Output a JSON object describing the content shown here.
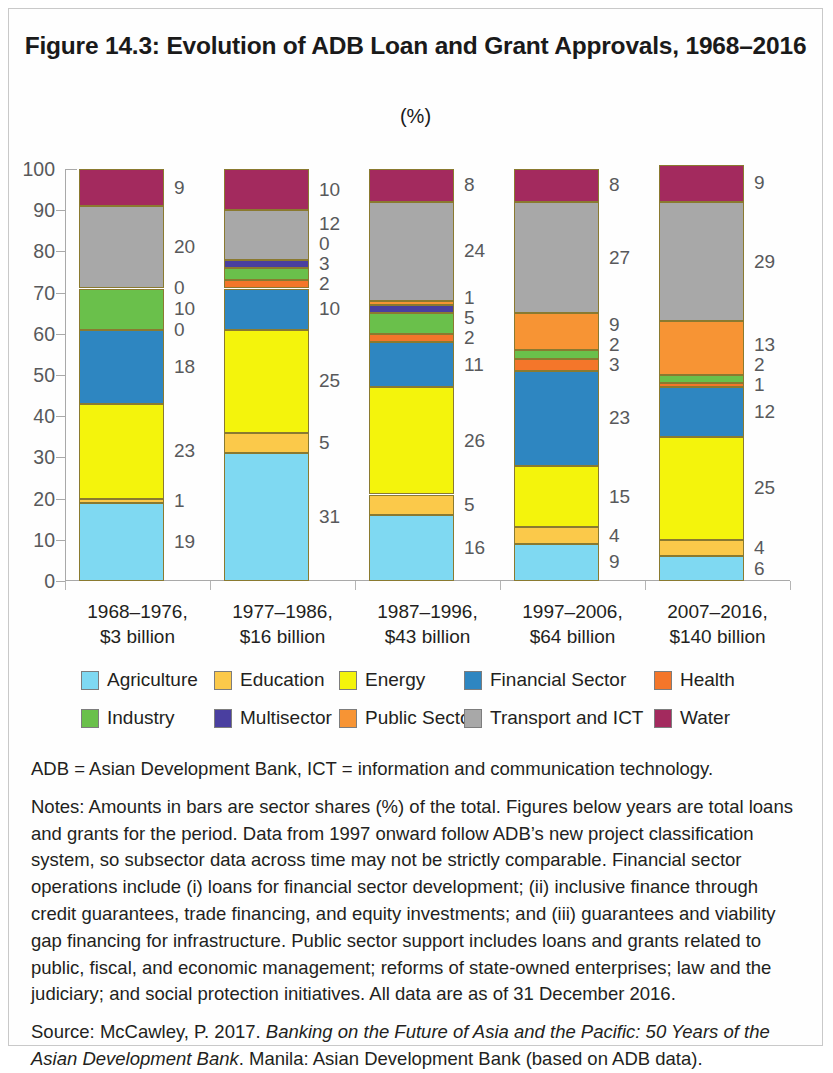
{
  "figure": {
    "title": "Figure 14.3: Evolution of ADB Loan and Grant Approvals, 1968–2016",
    "subtitle": "(%)"
  },
  "abbreviations": "ADB = Asian Development Bank, ICT = information and communication technology.",
  "notes": "Notes: Amounts in bars are sector shares (%) of the total. Figures below years are total loans and grants for the period. Data from 1997 onward follow ADB’s new project classification system, so subsector data across time may not be strictly comparable. Financial sector operations include (i) loans for financial sector development; (ii) inclusive finance through credit guarantees, trade financing, and equity investments; and (iii) guarantees and viability gap financing for infrastructure. Public sector support includes loans and grants related to public, fiscal, and economic management; reforms of state-owned enterprises; law and the judiciary; and social protection initiatives. All data are as of 31 December 2016.",
  "source": {
    "lead": "Source: McCawley, P. 2017. ",
    "italic_title": "Banking on the Future of Asia and the Pacific: 50 Years of the Asian Development Bank",
    "tail": ". Manila: Asian Development Bank (based on ADB data)."
  },
  "chart_data": {
    "type": "bar",
    "stacked": true,
    "title": "Figure 14.3: Evolution of ADB Loan and Grant Approvals, 1968–2016",
    "subtitle": "(%)",
    "xlabel": "",
    "ylabel": "",
    "ylim": [
      0,
      100
    ],
    "yticks": [
      0,
      10,
      20,
      30,
      40,
      50,
      60,
      70,
      80,
      90,
      100
    ],
    "grid": false,
    "legend_position": "bottom",
    "categories": [
      "1968–1976,\n$3 billion",
      "1977–1986,\n$16 billion",
      "1987–1996,\n$43 billion",
      "1997–2006,\n$64 billion",
      "2007–2016,\n$140 billion"
    ],
    "category_lines": [
      [
        "1968–1976,",
        "$3 billion"
      ],
      [
        "1977–1986,",
        "$16 billion"
      ],
      [
        "1987–1996,",
        "$43 billion"
      ],
      [
        "1997–2006,",
        "$64 billion"
      ],
      [
        "2007–2016,",
        "$140 billion"
      ]
    ],
    "series": [
      {
        "name": "Agriculture",
        "color": "#7fd9f2",
        "values": [
          19,
          31,
          16,
          9,
          6
        ]
      },
      {
        "name": "Education",
        "color": "#fcc councillors"
      }
    ],
    "stack_order": [
      "Agriculture",
      "Education",
      "Energy",
      "Financial Sector",
      "Health",
      "Industry",
      "Multisector",
      "Public Sector",
      "Transport and ICT",
      "Water"
    ],
    "series_full": [
      {
        "name": "Agriculture",
        "color": "#7fd9f2",
        "values": [
          19,
          31,
          16,
          9,
          6
        ]
      },
      {
        "name": "Education",
        "color": "#fcc css"
      }
    ]
  },
  "legend": {
    "items": [
      {
        "label": "Agriculture",
        "color": "#7fd9f2"
      },
      {
        "label": "Education",
        "color": "#fbc94a"
      },
      {
        "label": "Energy",
        "color": "#f4f40c"
      },
      {
        "label": "Financial Sector",
        "color": "#2e86c1"
      },
      {
        "label": "Health",
        "color": "#f4762a"
      },
      {
        "label": "Industry",
        "color": "#6ac04b"
      },
      {
        "label": "Multisector",
        "color": "#4a3fa0"
      },
      {
        "label": "Public Sector",
        "color": "#f79434"
      },
      {
        "label": "Transport and ICT",
        "color": "#a8a8a8"
      },
      {
        "label": "Water",
        "color": "#a32a5e"
      }
    ]
  },
  "axis": {
    "y_tick_labels": [
      "100",
      "90",
      "80",
      "70",
      "60",
      "50",
      "40",
      "30",
      "20",
      "10",
      "0"
    ]
  },
  "bars": [
    {
      "category_line1": "1968–1976,",
      "category_line2": "$3 billion",
      "segments": [
        {
          "sector": "Agriculture",
          "value": 19,
          "label": "19",
          "color": "#7fd9f2"
        },
        {
          "sector": "Education",
          "value": 1,
          "label": "1",
          "color": "#fbc94a"
        },
        {
          "sector": "Energy",
          "value": 23,
          "label": "23",
          "color": "#f4f40c"
        },
        {
          "sector": "Financial Sector",
          "value": 18,
          "label": "18",
          "color": "#2e86c1"
        },
        {
          "sector": "Health",
          "value": 0,
          "label": "0",
          "color": "#f4762a"
        },
        {
          "sector": "Industry",
          "value": 10,
          "label": "10",
          "color": "#6ac04b"
        },
        {
          "sector": "Multisector",
          "value": 0,
          "label": "0",
          "color": "#4a3fa0"
        },
        {
          "sector": "Public Sector",
          "value": 0,
          "label": "",
          "color": "#f79434"
        },
        {
          "sector": "Transport and ICT",
          "value": 20,
          "label": "20",
          "color": "#a8a8a8"
        },
        {
          "sector": "Water",
          "value": 9,
          "label": "9",
          "color": "#a32a5e"
        }
      ]
    },
    {
      "category_line1": "1977–1986,",
      "category_line2": "$16 billion",
      "segments": [
        {
          "sector": "Agriculture",
          "value": 31,
          "label": "31",
          "color": "#7fd9f2"
        },
        {
          "sector": "Education",
          "value": 5,
          "label": "5",
          "color": "#fbc94a"
        },
        {
          "sector": "Energy",
          "value": 25,
          "label": "25",
          "color": "#f4f40c"
        },
        {
          "sector": "Financial Sector",
          "value": 10,
          "label": "10",
          "color": "#2e86c1"
        },
        {
          "sector": "Health",
          "value": 2,
          "label": "2",
          "color": "#f4762a"
        },
        {
          "sector": "Industry",
          "value": 3,
          "label": "3",
          "color": "#6ac04b"
        },
        {
          "sector": "Multisector",
          "value": 2,
          "label": "0",
          "color": "#4a3fa0"
        },
        {
          "sector": "Public Sector",
          "value": 0,
          "label": "",
          "color": "#f79434"
        },
        {
          "sector": "Transport and ICT",
          "value": 12,
          "label": "12",
          "color": "#a8a8a8"
        },
        {
          "sector": "Water",
          "value": 10,
          "label": "10",
          "color": "#a32a5e"
        }
      ]
    },
    {
      "category_line1": "1987–1996,",
      "category_line2": "$43 billion",
      "segments": [
        {
          "sector": "Agriculture",
          "value": 16,
          "label": "16",
          "color": "#7fd9f2"
        },
        {
          "sector": "Education",
          "value": 5,
          "label": "5",
          "color": "#fbc94a"
        },
        {
          "sector": "Energy",
          "value": 26,
          "label": "26",
          "color": "#f4f40c"
        },
        {
          "sector": "Financial Sector",
          "value": 11,
          "label": "11",
          "color": "#2e86c1"
        },
        {
          "sector": "Health",
          "value": 2,
          "label": "2",
          "color": "#f4762a"
        },
        {
          "sector": "Industry",
          "value": 5,
          "label": "5",
          "color": "#6ac04b"
        },
        {
          "sector": "Multisector",
          "value": 2,
          "label": "1",
          "color": "#4a3fa0"
        },
        {
          "sector": "Public Sector",
          "value": 1,
          "label": "",
          "color": "#f79434"
        },
        {
          "sector": "Transport and ICT",
          "value": 24,
          "label": "24",
          "color": "#a8a8a8"
        },
        {
          "sector": "Water",
          "value": 8,
          "label": "8",
          "color": "#a32a5e"
        }
      ]
    },
    {
      "category_line1": "1997–2006,",
      "category_line2": "$64 billion",
      "segments": [
        {
          "sector": "Agriculture",
          "value": 9,
          "label": "9",
          "color": "#7fd9f2"
        },
        {
          "sector": "Education",
          "value": 4,
          "label": "4",
          "color": "#fbc94a"
        },
        {
          "sector": "Energy",
          "value": 15,
          "label": "15",
          "color": "#f4f40c"
        },
        {
          "sector": "Financial Sector",
          "value": 23,
          "label": "23",
          "color": "#2e86c1"
        },
        {
          "sector": "Health",
          "value": 3,
          "label": "3",
          "color": "#f4762a"
        },
        {
          "sector": "Industry",
          "value": 2,
          "label": "2",
          "color": "#6ac04b"
        },
        {
          "sector": "Multisector",
          "value": 0,
          "label": "",
          "color": "#4a3fa0"
        },
        {
          "sector": "Public Sector",
          "value": 9,
          "label": "9",
          "color": "#f79434"
        },
        {
          "sector": "Transport and ICT",
          "value": 27,
          "label": "27",
          "color": "#a8a8a8"
        },
        {
          "sector": "Water",
          "value": 8,
          "label": "8",
          "color": "#a32a5e"
        }
      ]
    },
    {
      "category_line1": "2007–2016,",
      "category_line2": "$140 billion",
      "segments": [
        {
          "sector": "Agriculture",
          "value": 6,
          "label": "6",
          "color": "#7fd9f2"
        },
        {
          "sector": "Education",
          "value": 4,
          "label": "4",
          "color": "#fbc94a"
        },
        {
          "sector": "Energy",
          "value": 25,
          "label": "25",
          "color": "#f4f40c"
        },
        {
          "sector": "Financial Sector",
          "value": 12,
          "label": "12",
          "color": "#2e86c1"
        },
        {
          "sector": "Health",
          "value": 1,
          "label": "1",
          "color": "#f4762a"
        },
        {
          "sector": "Industry",
          "value": 2,
          "label": "2",
          "color": "#6ac04b"
        },
        {
          "sector": "Multisector",
          "value": 0,
          "label": "",
          "color": "#4a3fa0"
        },
        {
          "sector": "Public Sector",
          "value": 13,
          "label": "13",
          "color": "#f79434"
        },
        {
          "sector": "Transport and ICT",
          "value": 29,
          "label": "29",
          "color": "#a8a8a8"
        },
        {
          "sector": "Water",
          "value": 9,
          "label": "9",
          "color": "#a32a5e"
        }
      ]
    }
  ]
}
